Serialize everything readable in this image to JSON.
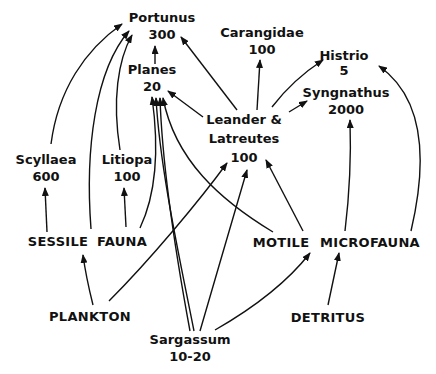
{
  "diagram": {
    "type": "food-web",
    "nodes": {
      "portunus": {
        "name": "Portunus",
        "value": "300"
      },
      "carangidae": {
        "name": "Carangidae",
        "value": "100"
      },
      "histrio": {
        "name": "Histrio",
        "value": "5"
      },
      "planes": {
        "name": "Planes",
        "value": "20"
      },
      "syngnathus": {
        "name": "Syngnathus",
        "value": "2000"
      },
      "leander": {
        "name": "Leander &",
        "name2": "Latreutes",
        "value": "100"
      },
      "scyllaea": {
        "name": "Scyllaea",
        "value": "600"
      },
      "litiopa": {
        "name": "Litiopa",
        "value": "100"
      },
      "sessile": {
        "name": "SESSILE"
      },
      "fauna": {
        "name": "FAUNA"
      },
      "motile": {
        "name": "MOTILE"
      },
      "microfauna": {
        "name": "MICROFAUNA"
      },
      "plankton": {
        "name": "PLANKTON"
      },
      "detritus": {
        "name": "DETRITUS"
      },
      "sargassum": {
        "name": "Sargassum",
        "value": "10-20"
      }
    },
    "edges": [
      {
        "from": "scyllaea",
        "to": "portunus"
      },
      {
        "from": "sessile-fauna",
        "to": "portunus"
      },
      {
        "from": "litiopa",
        "to": "portunus"
      },
      {
        "from": "planes",
        "to": "portunus"
      },
      {
        "from": "leander",
        "to": "portunus"
      },
      {
        "from": "sessile-fauna",
        "to": "scyllaea"
      },
      {
        "from": "sessile-fauna",
        "to": "litiopa"
      },
      {
        "from": "sessile-fauna",
        "to": "planes"
      },
      {
        "from": "leander",
        "to": "planes"
      },
      {
        "from": "leander",
        "to": "carangidae"
      },
      {
        "from": "leander",
        "to": "histrio"
      },
      {
        "from": "leander",
        "to": "syngnathus"
      },
      {
        "from": "sargassum",
        "to": "planes"
      },
      {
        "from": "sargassum",
        "to": "planes"
      },
      {
        "from": "motile-microfauna",
        "to": "planes"
      },
      {
        "from": "motile-microfauna",
        "to": "leander"
      },
      {
        "from": "plankton",
        "to": "sessile-fauna"
      },
      {
        "from": "plankton",
        "to": "leander"
      },
      {
        "from": "sargassum",
        "to": "leander"
      },
      {
        "from": "sargassum",
        "to": "motile-microfauna"
      },
      {
        "from": "detritus",
        "to": "motile-microfauna"
      },
      {
        "from": "motile-microfauna",
        "to": "syngnathus"
      },
      {
        "from": "motile-microfauna",
        "to": "histrio"
      }
    ]
  }
}
